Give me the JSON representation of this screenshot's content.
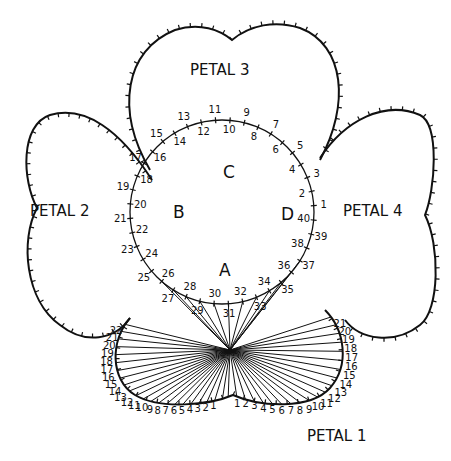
{
  "colors": {
    "ink": "#111111",
    "paper": "#ffffff"
  },
  "petals": [
    {
      "id": "petal-1",
      "label": "PETAL 1"
    },
    {
      "id": "petal-2",
      "label": "PETAL 2"
    },
    {
      "id": "petal-3",
      "label": "PETAL 3"
    },
    {
      "id": "petal-4",
      "label": "PETAL 4"
    }
  ],
  "center_sections": [
    {
      "id": "section-a",
      "label": "A"
    },
    {
      "id": "section-b",
      "label": "B"
    },
    {
      "id": "section-c",
      "label": "C"
    },
    {
      "id": "section-d",
      "label": "D"
    }
  ],
  "circle_points": [
    "1",
    "2",
    "3",
    "4",
    "5",
    "6",
    "7",
    "8",
    "9",
    "10",
    "11",
    "12",
    "13",
    "14",
    "15",
    "16",
    "17",
    "18",
    "19",
    "20",
    "21",
    "22",
    "23",
    "24",
    "25",
    "26",
    "27",
    "28",
    "29",
    "30",
    "31",
    "32",
    "33",
    "34",
    "35",
    "36",
    "37",
    "38",
    "39",
    "40"
  ],
  "petal1_left_points": [
    "1",
    "2",
    "3",
    "4",
    "5",
    "6",
    "7",
    "8",
    "9",
    "10",
    "11",
    "12",
    "13",
    "14",
    "15",
    "16",
    "17",
    "18",
    "19",
    "20",
    "21",
    "22"
  ],
  "petal1_right_points": [
    "1",
    "2",
    "3",
    "4",
    "5",
    "6",
    "7",
    "8",
    "9",
    "10",
    "11",
    "12",
    "13",
    "14",
    "15",
    "16",
    "17",
    "18",
    "19",
    "20",
    "21"
  ]
}
